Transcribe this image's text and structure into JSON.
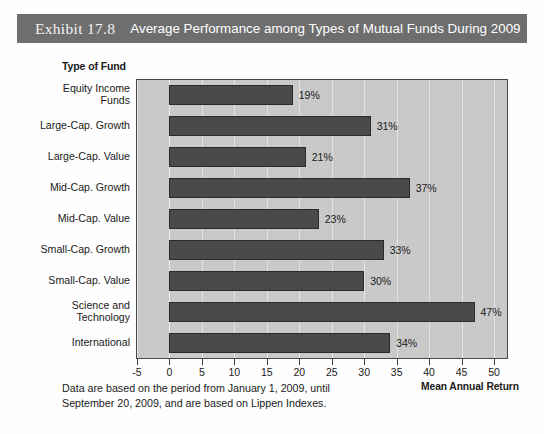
{
  "title": {
    "exhibit": "Exhibit 17.8",
    "text": "Average Performance among Types of Mutual Funds During 2009"
  },
  "axis_header": "Type of Fund",
  "x_axis_title": "Mean Annual Return",
  "footnote": {
    "line1": "Data are based on the period from January 1, 2009, until",
    "line2": "September 20, 2009, and are based on Lippen Indexes."
  },
  "colors": {
    "banner": "#6e6e6e",
    "plot_background": "#c9c9c9",
    "bar_fill": "#4a4a4a",
    "gridline": "#e2e2e2",
    "text": "#1a1a1a"
  },
  "chart_data": {
    "type": "bar",
    "orientation": "horizontal",
    "title": "Average Performance among Types of Mutual Funds During 2009",
    "xlabel": "Mean Annual Return",
    "ylabel": "Type of Fund",
    "xlim": [
      -5,
      52
    ],
    "grid": true,
    "legend": "none",
    "xticks": [
      -5,
      0,
      5,
      10,
      15,
      20,
      25,
      30,
      35,
      40,
      45,
      50
    ],
    "xtick_labels": [
      "-5",
      "0",
      "5",
      "10",
      "15",
      "20",
      "25",
      "30",
      "35",
      "40",
      "45",
      "50"
    ],
    "categories": [
      "Equity Income\nFunds",
      "Large-Cap. Growth",
      "Large-Cap. Value",
      "Mid-Cap. Growth",
      "Mid-Cap. Value",
      "Small-Cap. Growth",
      "Small-Cap. Value",
      "Science and\nTechnology",
      "International"
    ],
    "values": [
      19,
      31,
      21,
      37,
      23,
      33,
      30,
      47,
      34
    ],
    "data_labels": [
      "19%",
      "31%",
      "21%",
      "37%",
      "23%",
      "33%",
      "30%",
      "47%",
      "34%"
    ],
    "annotation": "Data are based on the period from January 1, 2009, until September 20, 2009, and are based on Lippen Indexes."
  }
}
